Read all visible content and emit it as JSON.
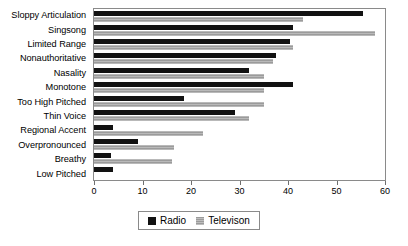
{
  "chart_data": {
    "type": "bar",
    "orientation": "horizontal",
    "title": "",
    "xlabel": "",
    "ylabel": "",
    "xlim": [
      0,
      60
    ],
    "xticks": [
      0,
      10,
      20,
      30,
      40,
      50,
      60
    ],
    "xtick_labels": [
      "0",
      "10",
      "20",
      "30",
      "40",
      "50",
      "60"
    ],
    "grid": false,
    "legend_position": "bottom-center",
    "categories": [
      "Sloppy Articulation",
      "Singsong",
      "Limited Range",
      "Nonauthoritative",
      "Nasality",
      "Monotone",
      "Too High Pitched",
      "Thin Voice",
      "Regional Accent",
      "Overpronounced",
      "Breathy",
      "Low Pitched"
    ],
    "series": [
      {
        "name": "Radio",
        "color": "#121212",
        "values": [
          55.5,
          41,
          40.5,
          37.5,
          32,
          41,
          18.5,
          29,
          4,
          9,
          3.5,
          4
        ]
      },
      {
        "name": "Televison",
        "color": "#9b9b9b",
        "values": [
          43,
          58,
          41,
          37,
          35,
          35,
          35,
          32,
          22.5,
          16.5,
          16,
          0
        ]
      }
    ]
  },
  "legend": {
    "items": [
      {
        "label": "Radio"
      },
      {
        "label": "Televison"
      }
    ]
  }
}
